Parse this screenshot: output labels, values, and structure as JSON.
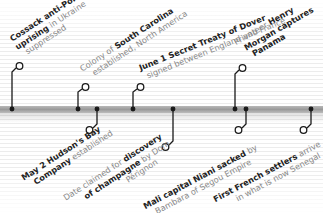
{
  "timeline": {
    "colors": {
      "bold_text": "#222222",
      "light_text": "#888888",
      "bar": "#a0a0a0",
      "marker": "#1a1a1a"
    },
    "events_above": [
      {
        "id": "cossack",
        "lines": [
          [
            {
              "t": "Cossack anti-Polish",
              "b": true
            }
          ],
          [
            {
              "t": "uprising",
              "b": true
            },
            {
              "t": " in Ukraine",
              "b": false
            }
          ],
          [
            {
              "t": "suppressed",
              "b": false
            }
          ]
        ]
      },
      {
        "id": "carolina",
        "lines": [
          [
            {
              "t": "Colony of ",
              "b": false
            },
            {
              "t": "South Carolina",
              "b": true
            }
          ],
          [
            {
              "t": "established, North America",
              "b": false
            }
          ]
        ]
      },
      {
        "id": "dover",
        "lines": [
          [
            {
              "t": "June 1 Secret Treaty of Dover",
              "b": true
            }
          ],
          [
            {
              "t": "signed between England and France",
              "b": false
            }
          ]
        ]
      },
      {
        "id": "morgan",
        "lines": [
          [
            {
              "t": "Privateer ",
              "b": false
            },
            {
              "t": "Henry",
              "b": true
            }
          ],
          [
            {
              "t": "Morgan captures",
              "b": true
            }
          ],
          [
            {
              "t": "Panama",
              "b": true
            }
          ]
        ]
      }
    ],
    "events_below": [
      {
        "id": "hudson",
        "lines": [
          [
            {
              "t": "May 2 Hudson's Bay",
              "b": true
            }
          ],
          [
            {
              "t": "Company",
              "b": true
            },
            {
              "t": " established",
              "b": false
            }
          ]
        ]
      },
      {
        "id": "champagne",
        "lines": [
          [
            {
              "t": "Date claimed for ",
              "b": false
            },
            {
              "t": "discovery",
              "b": true
            }
          ],
          [
            {
              "t": "of champagne",
              "b": true
            },
            {
              "t": " by Dom",
              "b": false
            }
          ],
          [
            {
              "t": "Pérignon",
              "b": false
            }
          ]
        ]
      },
      {
        "id": "niani",
        "lines": [
          [
            {
              "t": "Mali capital Niani sacked",
              "b": true
            },
            {
              "t": " by",
              "b": false
            }
          ],
          [
            {
              "t": "Bambara of Segou Empire",
              "b": false
            }
          ]
        ]
      },
      {
        "id": "senegal",
        "lines": [
          [
            {
              "t": "First French settlers",
              "b": true
            },
            {
              "t": " arrive",
              "b": false
            }
          ],
          [
            {
              "t": "in what is now Senegal",
              "b": false
            }
          ]
        ]
      }
    ]
  }
}
